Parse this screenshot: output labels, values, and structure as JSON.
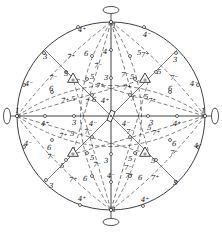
{
  "diagram": {
    "type": "stereographic-projection",
    "colors": {
      "ink": "#2a2a2a",
      "background": "#ffffff"
    },
    "primitive_circle": {
      "cx": 111,
      "cy": 116,
      "r": 94
    },
    "twofold_axes": [
      {
        "id": "north",
        "x": 111,
        "y": 22,
        "ox": 111,
        "oy": 10,
        "rx": 8,
        "ry": 3.5,
        "orient": "h"
      },
      {
        "id": "south",
        "x": 111,
        "y": 210,
        "ox": 111,
        "oy": 222,
        "rx": 8,
        "ry": 3.5,
        "orient": "h"
      },
      {
        "id": "west",
        "x": 17,
        "y": 116,
        "ox": 7,
        "oy": 116,
        "rx": 3.5,
        "ry": 8,
        "orient": "v"
      },
      {
        "id": "east",
        "x": 205,
        "y": 116,
        "ox": 215,
        "oy": 116,
        "rx": 3.5,
        "ry": 8,
        "orient": "v"
      }
    ],
    "threefold_triangles": [
      {
        "id": "nw",
        "x": 73,
        "y": 79
      },
      {
        "id": "ne",
        "x": 145,
        "y": 79
      },
      {
        "id": "sw",
        "x": 73,
        "y": 153
      },
      {
        "id": "se",
        "x": 145,
        "y": 153
      }
    ],
    "center_symbol": {
      "x": 111,
      "y": 116
    },
    "labels": [
      {
        "text": "4⁺",
        "x": 78,
        "y": 32
      },
      {
        "text": "4⁻",
        "x": 143,
        "y": 37
      },
      {
        "text": "3",
        "x": 43,
        "y": 59
      },
      {
        "text": "3",
        "x": 173,
        "y": 62
      },
      {
        "text": "7̄⁺",
        "x": 67,
        "y": 59
      },
      {
        "text": "6",
        "x": 84,
        "y": 56
      },
      {
        "text": "4⁻",
        "x": 103,
        "y": 54
      },
      {
        "text": "7⁺",
        "x": 141,
        "y": 57
      },
      {
        "text": "5",
        "x": 137,
        "y": 55
      },
      {
        "text": "7̄⁻",
        "x": 49,
        "y": 80
      },
      {
        "text": "5",
        "x": 64,
        "y": 76
      },
      {
        "text": "7̄⁻",
        "x": 94,
        "y": 68
      },
      {
        "text": "5",
        "x": 90,
        "y": 79
      },
      {
        "text": "3",
        "x": 104,
        "y": 80
      },
      {
        "text": "5",
        "x": 130,
        "y": 79
      },
      {
        "text": "7⁻",
        "x": 121,
        "y": 77
      },
      {
        "text": "5",
        "x": 157,
        "y": 74
      },
      {
        "text": "7⁻",
        "x": 170,
        "y": 80
      },
      {
        "text": "4⁻",
        "x": 25,
        "y": 86
      },
      {
        "text": "6",
        "x": 49,
        "y": 91
      },
      {
        "text": "7̄⁺",
        "x": 96,
        "y": 88
      },
      {
        "text": "7⁺",
        "x": 123,
        "y": 90
      },
      {
        "text": "6",
        "x": 168,
        "y": 91
      },
      {
        "text": "4⁻",
        "x": 190,
        "y": 86
      },
      {
        "text": "7̄⁺",
        "x": 61,
        "y": 103
      },
      {
        "text": "5",
        "x": 71,
        "y": 101
      },
      {
        "text": "7̄⁻",
        "x": 85,
        "y": 104
      },
      {
        "text": "6",
        "x": 92,
        "y": 102
      },
      {
        "text": "4⁺",
        "x": 101,
        "y": 103
      },
      {
        "text": "7⁻",
        "x": 130,
        "y": 101
      },
      {
        "text": "5",
        "x": 144,
        "y": 99
      },
      {
        "text": "7⁺",
        "x": 148,
        "y": 103
      },
      {
        "text": "1",
        "x": 15,
        "y": 113
      },
      {
        "text": "1",
        "x": 112,
        "y": 28
      },
      {
        "text": "1",
        "x": 201,
        "y": 113
      },
      {
        "text": "1",
        "x": 112,
        "y": 212
      },
      {
        "text": "4⁺",
        "x": 41,
        "y": 126
      },
      {
        "text": "3",
        "x": 72,
        "y": 125
      },
      {
        "text": "4⁻",
        "x": 89,
        "y": 126
      },
      {
        "text": "4⁻",
        "x": 122,
        "y": 126
      },
      {
        "text": "3",
        "x": 149,
        "y": 125
      },
      {
        "text": "4⁺",
        "x": 173,
        "y": 126
      },
      {
        "text": "7̄⁺",
        "x": 59,
        "y": 138
      },
      {
        "text": "5",
        "x": 70,
        "y": 136
      },
      {
        "text": "7̄⁻",
        "x": 84,
        "y": 134
      },
      {
        "text": "7⁻",
        "x": 126,
        "y": 134
      },
      {
        "text": "5",
        "x": 147,
        "y": 130
      },
      {
        "text": "7⁺",
        "x": 152,
        "y": 135
      },
      {
        "text": "4⁻",
        "x": 24,
        "y": 146
      },
      {
        "text": "6",
        "x": 47,
        "y": 150
      },
      {
        "text": "7̄⁻",
        "x": 47,
        "y": 159
      },
      {
        "text": "6",
        "x": 172,
        "y": 146
      },
      {
        "text": "7⁻",
        "x": 170,
        "y": 155
      },
      {
        "text": "4⁻",
        "x": 194,
        "y": 148
      },
      {
        "text": "5",
        "x": 90,
        "y": 160
      },
      {
        "text": "3",
        "x": 104,
        "y": 163
      },
      {
        "text": "5",
        "x": 128,
        "y": 161
      },
      {
        "text": "7⁻",
        "x": 124,
        "y": 170
      },
      {
        "text": "7̄⁻",
        "x": 93,
        "y": 167
      },
      {
        "text": "5",
        "x": 60,
        "y": 168
      },
      {
        "text": "7̄⁺",
        "x": 69,
        "y": 182
      },
      {
        "text": "6",
        "x": 83,
        "y": 181
      },
      {
        "text": "4⁻",
        "x": 107,
        "y": 178
      },
      {
        "text": "6",
        "x": 138,
        "y": 180
      },
      {
        "text": "7⁺",
        "x": 151,
        "y": 180
      },
      {
        "text": "5",
        "x": 151,
        "y": 163
      },
      {
        "text": "7⁺",
        "x": 125,
        "y": 178
      },
      {
        "text": "3",
        "x": 49,
        "y": 188
      },
      {
        "text": "3",
        "x": 173,
        "y": 185
      },
      {
        "text": "4⁺",
        "x": 78,
        "y": 201
      },
      {
        "text": "4⁺",
        "x": 141,
        "y": 202
      }
    ],
    "poles": [
      {
        "x": 78,
        "y": 27
      },
      {
        "x": 144,
        "y": 27
      },
      {
        "x": 44,
        "y": 53
      },
      {
        "x": 176,
        "y": 53
      },
      {
        "x": 24,
        "y": 85
      },
      {
        "x": 198,
        "y": 85
      },
      {
        "x": 24,
        "y": 147
      },
      {
        "x": 198,
        "y": 147
      },
      {
        "x": 46,
        "y": 180
      },
      {
        "x": 176,
        "y": 182
      },
      {
        "x": 80,
        "y": 205
      },
      {
        "x": 143,
        "y": 206
      },
      {
        "x": 111,
        "y": 50
      },
      {
        "x": 111,
        "y": 78
      },
      {
        "x": 111,
        "y": 154
      },
      {
        "x": 111,
        "y": 182
      },
      {
        "x": 45,
        "y": 116
      },
      {
        "x": 74,
        "y": 116
      },
      {
        "x": 148,
        "y": 116
      },
      {
        "x": 177,
        "y": 116
      },
      {
        "x": 66,
        "y": 72
      },
      {
        "x": 156,
        "y": 72
      },
      {
        "x": 66,
        "y": 160
      },
      {
        "x": 156,
        "y": 160
      },
      {
        "x": 52,
        "y": 92
      },
      {
        "x": 170,
        "y": 92
      },
      {
        "x": 52,
        "y": 140
      },
      {
        "x": 170,
        "y": 140
      },
      {
        "x": 92,
        "y": 56
      },
      {
        "x": 130,
        "y": 56
      },
      {
        "x": 92,
        "y": 176
      },
      {
        "x": 130,
        "y": 176
      },
      {
        "x": 92,
        "y": 95
      },
      {
        "x": 130,
        "y": 95
      },
      {
        "x": 92,
        "y": 137
      },
      {
        "x": 130,
        "y": 137
      },
      {
        "x": 87,
        "y": 79
      },
      {
        "x": 135,
        "y": 79
      },
      {
        "x": 87,
        "y": 153
      },
      {
        "x": 135,
        "y": 153
      }
    ]
  }
}
